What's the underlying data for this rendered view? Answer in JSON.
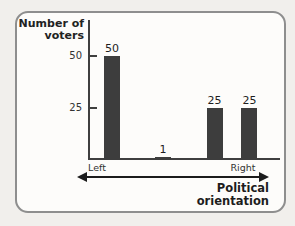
{
  "figure": {
    "kind": "textbook-bar-chart-figure",
    "background_color": "#f1efec",
    "card_color": "#fdfcfa",
    "border_color": "#8e8e8e"
  },
  "chart_data": {
    "type": "bar",
    "title": "",
    "ylabel": "Number of voters",
    "xlabel": "Political orientation",
    "x_axis_endpoints": [
      "Left",
      "Right"
    ],
    "values": [
      50,
      1,
      25,
      25
    ],
    "bar_labels": [
      "50",
      "1",
      "25",
      "25"
    ],
    "yticks": [
      25,
      50
    ],
    "ytick_labels": [
      "25",
      "50"
    ],
    "ylim": [
      0,
      55
    ],
    "grid": false,
    "legend": false,
    "bar_color": "#3d3d3d",
    "axis_color": "#3f3f3f",
    "x_axis_style": "double-headed-arrow",
    "layout": {
      "bar_center_fractions": [
        0.125,
        0.391,
        0.659,
        0.841
      ],
      "bar_width_px": 16
    }
  }
}
